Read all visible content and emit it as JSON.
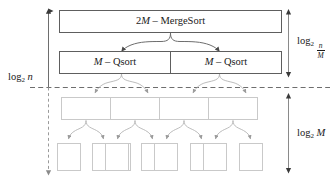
{
  "diagram": {
    "title_text": "Recursive sort decomposition",
    "levels": [
      {
        "name": "mergesort-level",
        "boxes": [
          {
            "label_prefix": "2",
            "label_italic": "M",
            "label_suffix": " – MergeSort",
            "full_text": "2M – MergeSort"
          }
        ]
      },
      {
        "name": "qsort-level",
        "boxes": [
          {
            "label_prefix": "",
            "label_italic": "M",
            "label_suffix": " – Qsort",
            "full_text": "M – Qsort"
          },
          {
            "label_prefix": "",
            "label_italic": "M",
            "label_suffix": " – Qsort",
            "full_text": "M – Qsort"
          }
        ]
      },
      {
        "name": "third-level",
        "boxes": [
          {
            "full_text": ""
          },
          {
            "full_text": ""
          },
          {
            "full_text": ""
          },
          {
            "full_text": ""
          }
        ]
      },
      {
        "name": "fourth-level",
        "boxes": [
          {
            "full_text": ""
          },
          {
            "full_text": ""
          },
          {
            "full_text": ""
          },
          {
            "full_text": ""
          },
          {
            "full_text": ""
          },
          {
            "full_text": ""
          },
          {
            "full_text": ""
          },
          {
            "full_text": ""
          }
        ]
      }
    ],
    "annotations": {
      "left_label": {
        "base": "log",
        "subscript": "2",
        "operand": "n",
        "full_text": "log2 n"
      },
      "top_right_label": {
        "base": "log",
        "subscript": "2",
        "numerator": "n",
        "denominator": "M",
        "full_text": "log2 n/M"
      },
      "bottom_right_label": {
        "base": "log",
        "subscript": "2",
        "operand": "M",
        "full_text": "log2 M"
      }
    },
    "colors": {
      "dark_border": "#5e5e5e",
      "light_border": "#c9c9c9",
      "connector": "#8a8a8a",
      "dashed_line": "#6e6e6e",
      "text": "#1a1a1a",
      "background": "#ffffff"
    }
  }
}
